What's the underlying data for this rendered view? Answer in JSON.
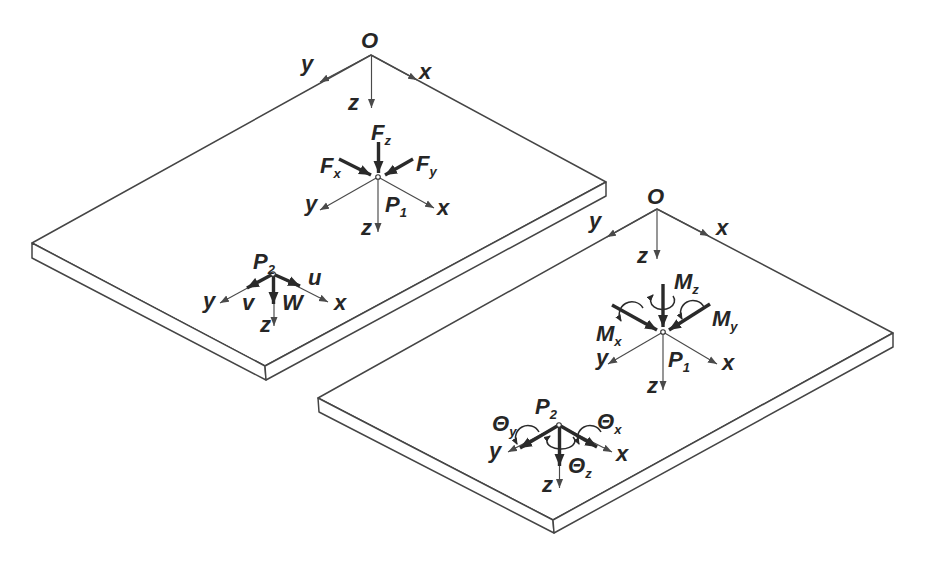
{
  "colors": {
    "plate_line": "#454545",
    "axis_line": "#4a4a4a",
    "vector": "#2a2a2a",
    "background": "#ffffff"
  },
  "left_plate": {
    "origin": {
      "label": "O",
      "x_axis": "x",
      "y_axis": "y",
      "z_axis": "z"
    },
    "point1": {
      "label_main": "P",
      "label_sub": "1",
      "x_axis": "x",
      "y_axis": "y",
      "z_axis": "z",
      "force_x_main": "F",
      "force_x_sub": "x",
      "force_y_main": "F",
      "force_y_sub": "y",
      "force_z_main": "F",
      "force_z_sub": "z"
    },
    "point2": {
      "label_main": "P",
      "label_sub": "2",
      "x_axis": "x",
      "y_axis": "y",
      "z_axis": "z",
      "disp_u": "u",
      "disp_v": "v",
      "disp_w": "W"
    }
  },
  "right_plate": {
    "origin": {
      "label": "O",
      "x_axis": "x",
      "y_axis": "y",
      "z_axis": "z"
    },
    "point1": {
      "label_main": "P",
      "label_sub": "1",
      "x_axis": "x",
      "y_axis": "y",
      "z_axis": "z",
      "moment_x_main": "M",
      "moment_x_sub": "x",
      "moment_y_main": "M",
      "moment_y_sub": "y",
      "moment_z_main": "M",
      "moment_z_sub": "z"
    },
    "point2": {
      "label_main": "P",
      "label_sub": "2",
      "x_axis": "x",
      "y_axis": "y",
      "z_axis": "z",
      "rot_x_main": "Θ",
      "rot_x_sub": "x",
      "rot_y_main": "Θ",
      "rot_y_sub": "y",
      "rot_z_main": "Θ",
      "rot_z_sub": "z"
    }
  }
}
